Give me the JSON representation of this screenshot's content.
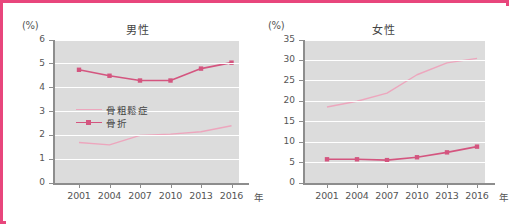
{
  "figure": {
    "border_color": "#e8467c",
    "background": "#ffffff",
    "plot_background": "#dcdcdc"
  },
  "series_colors": {
    "osteoporosis": "#eda6bd",
    "fracture": "#d4557f"
  },
  "legend": {
    "items": [
      {
        "label": "骨粗鬆症",
        "color": "#eda6bd",
        "marker": false
      },
      {
        "label": "骨折",
        "color": "#d4557f",
        "marker": true
      }
    ]
  },
  "charts": [
    {
      "id": "male",
      "title": "男性",
      "y_unit": "(%)",
      "x_unit": "年",
      "y_ticks": [
        "0",
        "1",
        "2",
        "3",
        "4",
        "5",
        "6"
      ],
      "x_ticks": [
        "2001",
        "2004",
        "2007",
        "2010",
        "2013",
        "2016"
      ]
    },
    {
      "id": "female",
      "title": "女性",
      "y_unit": "(%)",
      "x_unit": "年",
      "y_ticks": [
        "0",
        "5",
        "10",
        "15",
        "20",
        "25",
        "30",
        "35"
      ],
      "x_ticks": [
        "2001",
        "2004",
        "2007",
        "2010",
        "2013",
        "2016"
      ]
    }
  ],
  "chart_data": [
    {
      "type": "line",
      "title": "男性",
      "xlabel": "年",
      "ylabel": "(%)",
      "categories": [
        "2001",
        "2004",
        "2007",
        "2010",
        "2013",
        "2016"
      ],
      "ylim": [
        0,
        6
      ],
      "ytick_step": 1,
      "grid": true,
      "legend_position": "inside-left",
      "series": [
        {
          "name": "骨粗鬆症",
          "color": "#eda6bd",
          "marker": "none",
          "values": [
            1.7,
            1.6,
            2.0,
            2.05,
            2.15,
            2.4
          ]
        },
        {
          "name": "骨折",
          "color": "#d4557f",
          "marker": "square",
          "values": [
            4.75,
            4.5,
            4.3,
            4.3,
            4.8,
            5.05
          ]
        }
      ]
    },
    {
      "type": "line",
      "title": "女性",
      "xlabel": "年",
      "ylabel": "(%)",
      "categories": [
        "2001",
        "2004",
        "2007",
        "2010",
        "2013",
        "2016"
      ],
      "ylim": [
        0,
        35
      ],
      "ytick_step": 5,
      "grid": true,
      "legend_position": "none",
      "series": [
        {
          "name": "骨粗鬆症",
          "color": "#eda6bd",
          "marker": "none",
          "values": [
            18.6,
            20.0,
            22.0,
            26.5,
            29.4,
            30.5
          ]
        },
        {
          "name": "骨折",
          "color": "#d4557f",
          "marker": "square",
          "values": [
            5.8,
            5.8,
            5.6,
            6.3,
            7.5,
            8.9
          ]
        }
      ]
    }
  ]
}
